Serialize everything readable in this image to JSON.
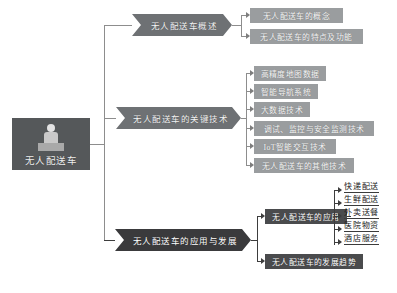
{
  "diagram": {
    "type": "mind-map",
    "title": "无人配送车",
    "root": {
      "label": "无人配送车",
      "icon": "delivery-robot-illustration",
      "color": "#55585a"
    },
    "branches": [
      {
        "id": "overview",
        "label": "无人配送车概述",
        "color": "#6e7174",
        "children": [
          {
            "label": "无人配送车的概念"
          },
          {
            "label": "无人配送车的特点及功能"
          }
        ]
      },
      {
        "id": "key-tech",
        "label": "无人配送车的关键技术",
        "color": "#6e7174",
        "children": [
          {
            "label": "高精度地图数据"
          },
          {
            "label": "智能导航系统"
          },
          {
            "label": "大数据技术"
          },
          {
            "label": "调试、监控与安全监测技术"
          },
          {
            "label": "IoT智能交互技术"
          },
          {
            "label": "无人配送车的其他技术"
          }
        ]
      },
      {
        "id": "application",
        "label": "无人配送车的应用与发展",
        "color": "#3a3a3c",
        "children": [
          {
            "label": "无人配送车的应用",
            "leaves": [
              "快递配送",
              "生鲜配送",
              "外卖送餐",
              "医院物资",
              "酒店服务"
            ]
          },
          {
            "label": "无人配送车的发展趋势",
            "leaves": []
          }
        ]
      }
    ],
    "colors": {
      "root_fill": "#55585a",
      "branch_fill": "#6e7174",
      "branch_fill_dark": "#3a3a3c",
      "child_fill": "#9a9d9f",
      "child_fill_dark": "#4a4b4d",
      "connector": "#8d8d8d",
      "connector_dark": "#3d3d3d",
      "text_light": "#f3f3f3",
      "leaf_text": "#1a1a1a",
      "background": "#ffffff"
    }
  }
}
